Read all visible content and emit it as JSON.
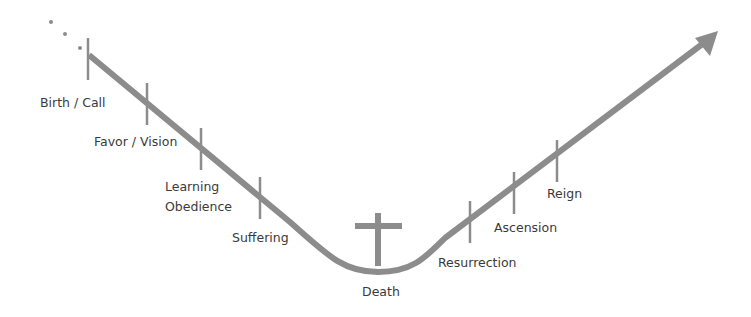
{
  "diagram": {
    "type": "v-shaped-journey-arrow",
    "colors": {
      "line": "#8c8c8c",
      "text": "#3a3a3a",
      "background": "#ffffff"
    },
    "start_marker": "ellipsis-dots",
    "end_marker": "arrow-head",
    "center_icon": "cross-icon",
    "stages": [
      {
        "id": "birth",
        "label": "Birth / Call"
      },
      {
        "id": "favor",
        "label": "Favor / Vision"
      },
      {
        "id": "learning",
        "label_line1": "Learning",
        "label_line2": "Obedience"
      },
      {
        "id": "suffering",
        "label": "Suffering"
      },
      {
        "id": "death",
        "label": "Death"
      },
      {
        "id": "resurrection",
        "label": "Resurrection"
      },
      {
        "id": "ascension",
        "label": "Ascension"
      },
      {
        "id": "reign",
        "label": "Reign"
      }
    ]
  }
}
